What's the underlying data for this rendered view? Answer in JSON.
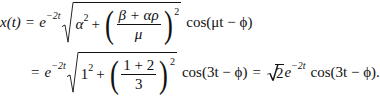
{
  "equation": {
    "line1": {
      "lhs": "x(t)",
      "eq": "=",
      "exp_base": "e",
      "exp_power": "−2t",
      "alpha": "α",
      "alpha_pow": "2",
      "plus": "+",
      "frac_num": "β + αρ",
      "frac_den": "μ",
      "paren_pow": "2",
      "cos_text": "cos(μt − ϕ)"
    },
    "line2": {
      "eq": "=",
      "exp_base": "e",
      "exp_power": "−2t",
      "one": "1",
      "one_pow": "2",
      "plus": "+",
      "frac_num": "1 + 2",
      "frac_den": "3",
      "paren_pow": "2",
      "cos_text": "cos(3t − ϕ)",
      "eq2": "=",
      "sqrt_val": "2",
      "exp_base2": "e",
      "exp_power2": "−2t",
      "cos_text2": "cos(3t − ϕ)."
    }
  }
}
